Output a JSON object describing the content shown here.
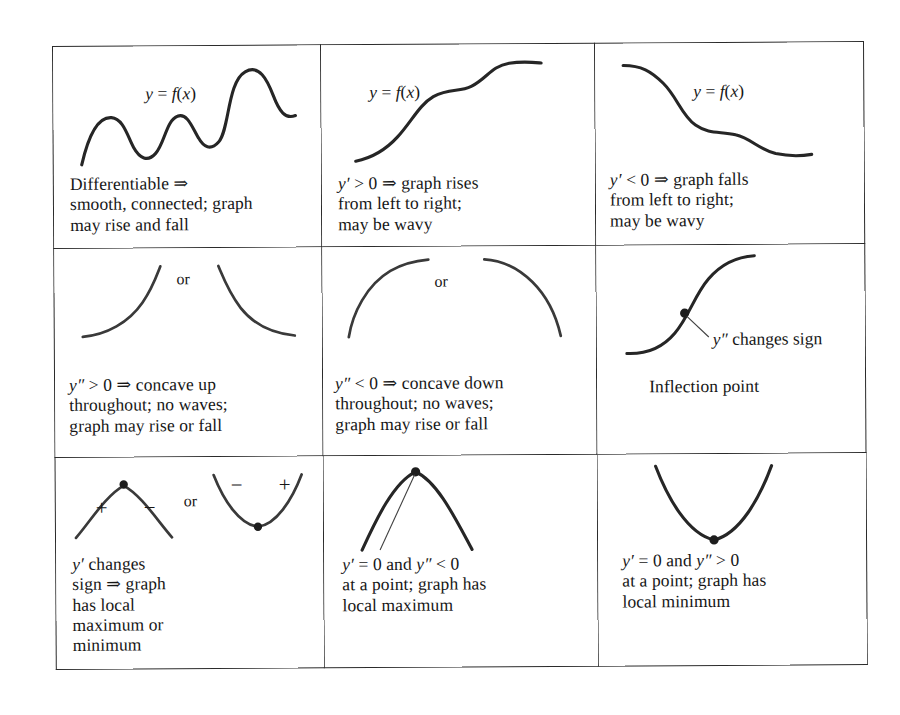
{
  "document": {
    "title": "Behavior of graph from y' and y''",
    "rows": 3,
    "columns": 3
  },
  "cells": [
    {
      "id": "differentiable",
      "fig_label": "y = f(x)",
      "caption": "Differentiable ⇒\nsmooth, connected; graph\nmay rise and fall",
      "curve": "wavy-rising"
    },
    {
      "id": "increasing",
      "fig_label": "y = f(x)",
      "caption": "y′ > 0 ⇒ graph rises\nfrom left to right;\nmay be wavy",
      "curve": "s-curve-rising"
    },
    {
      "id": "decreasing",
      "fig_label": "y = f(x)",
      "caption": "y′ < 0 ⇒ graph falls\nfrom left to right;\nmay be wavy",
      "curve": "s-curve-falling"
    },
    {
      "id": "concave-up",
      "or_label": "or",
      "caption": "y″ > 0 ⇒ concave up\nthroughout; no waves;\ngraph may rise or fall",
      "curve": "concave-up-pair"
    },
    {
      "id": "concave-down",
      "or_label": "or",
      "caption": "y″ < 0 ⇒ concave down\nthroughout; no waves;\ngraph may rise or fall",
      "curve": "concave-down-pair"
    },
    {
      "id": "inflection-point",
      "annotation": "y″ changes sign",
      "caption": "Inflection point",
      "curve": "s-curve-with-inflection-dot"
    },
    {
      "id": "local-extremum",
      "or_label": "or",
      "signs": [
        "+",
        "−",
        "−",
        "+"
      ],
      "caption": "y′ changes\nsign ⇒ graph\nhas local\nmaximum or\nminimum",
      "curve": "max-and-min-pair"
    },
    {
      "id": "local-maximum",
      "caption": "y′ = 0  and  y″ < 0\nat a point; graph has\nlocal maximum",
      "curve": "arch-with-vertex-dot"
    },
    {
      "id": "local-minimum",
      "caption": "y′ = 0  and  y″ > 0\nat a point; graph has\nlocal minimum",
      "curve": "valley-with-vertex-dot"
    }
  ],
  "colors": {
    "ink": "#262626",
    "border": "#2b2b2b",
    "paper": "#ffffff"
  }
}
